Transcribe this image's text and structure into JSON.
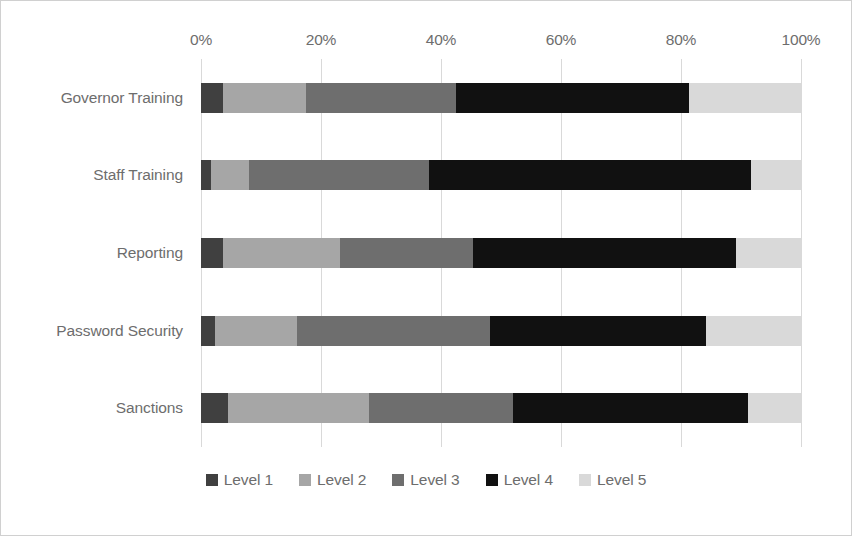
{
  "chart_data": {
    "type": "bar",
    "orientation": "horizontal",
    "stacked": true,
    "normalized": true,
    "title": "",
    "subtitle": "",
    "xlabel": "",
    "ylabel": "",
    "xlim": [
      0,
      100
    ],
    "xticks": [
      0,
      20,
      40,
      60,
      80,
      100
    ],
    "xtick_labels": [
      "0%",
      "20%",
      "40%",
      "60%",
      "80%",
      "100%"
    ],
    "grid": true,
    "grid_axis": "x",
    "legend_position": "bottom",
    "categories": [
      "Governor Training",
      "Staff Training",
      "Reporting",
      "Password Security",
      "Sanctions"
    ],
    "series": [
      {
        "name": "Level 1",
        "color": "#404040",
        "values": [
          3.7,
          1.7,
          3.7,
          2.3,
          4.5
        ]
      },
      {
        "name": "Level 2",
        "color": "#a6a6a6",
        "values": [
          17.5,
          8.0,
          23.2,
          16.0,
          28.0
        ]
      },
      {
        "name": "Level 3",
        "color": "#6e6e6e",
        "values": [
          42.5,
          38.0,
          45.3,
          48.2,
          52.0
        ]
      },
      {
        "name": "Level 4",
        "color": "#111111",
        "values": [
          81.3,
          91.7,
          89.2,
          84.2,
          91.2
        ]
      },
      {
        "name": "Level 5",
        "color": "#d9d9d9",
        "values": [
          100,
          100,
          100,
          100,
          100
        ]
      }
    ],
    "segment_values": [
      {
        "category": "Governor Training",
        "Level 1": 3.7,
        "Level 2": 13.8,
        "Level 3": 25.0,
        "Level 4": 38.8,
        "Level 5": 18.7
      },
      {
        "category": "Staff Training",
        "Level 1": 1.7,
        "Level 2": 6.3,
        "Level 3": 30.0,
        "Level 4": 53.7,
        "Level 5": 8.3
      },
      {
        "category": "Reporting",
        "Level 1": 3.7,
        "Level 2": 19.5,
        "Level 3": 22.1,
        "Level 4": 43.9,
        "Level 5": 10.8
      },
      {
        "category": "Password Security",
        "Level 1": 2.3,
        "Level 2": 13.7,
        "Level 3": 32.2,
        "Level 4": 36.0,
        "Level 5": 15.8
      },
      {
        "category": "Sanctions",
        "Level 1": 4.5,
        "Level 2": 23.5,
        "Level 3": 24.0,
        "Level 4": 39.2,
        "Level 5": 8.8
      }
    ]
  },
  "legend": {
    "items": [
      {
        "label": "Level 1",
        "color": "#404040"
      },
      {
        "label": "Level 2",
        "color": "#a6a6a6"
      },
      {
        "label": "Level 3",
        "color": "#6e6e6e"
      },
      {
        "label": "Level 4",
        "color": "#111111"
      },
      {
        "label": "Level 5",
        "color": "#d9d9d9"
      }
    ]
  },
  "colors": {
    "background": "#ffffff",
    "frame_border": "#d0d0d0",
    "gridline": "#d9d9d9",
    "text": "#6d6d6d"
  }
}
